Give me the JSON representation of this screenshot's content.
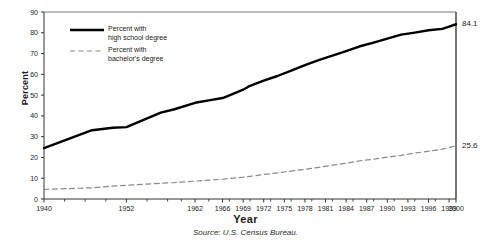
{
  "chart_data": {
    "type": "line",
    "title": "",
    "xlabel": "Year",
    "ylabel": "Percent",
    "source": "Source: U.S. Census Bureau.",
    "xlim": [
      1940,
      2000
    ],
    "ylim": [
      0,
      90
    ],
    "ytick_step": 10,
    "grid": false,
    "legend_position": "top-left-inside",
    "yticks": [
      "0",
      "10",
      "20",
      "30",
      "40",
      "50",
      "60",
      "70",
      "80",
      "90"
    ],
    "xticks": [
      "1940",
      "1952",
      "1962",
      "1966",
      "1969",
      "1972",
      "1975",
      "1978",
      "1981",
      "1984",
      "1987",
      "1990",
      "1993",
      "1996",
      "1999",
      "2000"
    ],
    "xtick_positions": [
      1940,
      1952,
      1962,
      1966,
      1969,
      1972,
      1975,
      1978,
      1981,
      1984,
      1987,
      1990,
      1993,
      1996,
      1999,
      2000
    ],
    "minor_xticks": [
      1943,
      1946,
      1949,
      1955,
      1958,
      1960,
      1964,
      1967,
      1970,
      1973,
      1976,
      1979,
      1982,
      1985,
      1988,
      1991,
      1994,
      1997
    ],
    "series": [
      {
        "name": "Percent with high school degree",
        "legend_label": "Percent with\nhigh school degree",
        "style": "solid",
        "color": "#000000",
        "width": 2.4,
        "end_value_label": "84.1",
        "x": [
          1940,
          1947,
          1950,
          1952,
          1957,
          1959,
          1962,
          1964,
          1966,
          1967,
          1969,
          1970,
          1972,
          1974,
          1976,
          1978,
          1980,
          1982,
          1984,
          1986,
          1988,
          1990,
          1992,
          1994,
          1996,
          1998,
          1999,
          2000
        ],
        "values": [
          24.5,
          33.1,
          34.3,
          34.6,
          41.6,
          43.2,
          46.3,
          47.5,
          48.6,
          49.9,
          52.6,
          54.5,
          57.0,
          59.2,
          61.8,
          64.4,
          66.8,
          69.0,
          71.2,
          73.5,
          75.3,
          77.2,
          79.1,
          80.1,
          81.2,
          81.9,
          83.0,
          84.1
        ]
      },
      {
        "name": "Percent with bachelor's degree",
        "legend_label": "Percent with\nbachelor's degree",
        "style": "dashed",
        "color": "#8a8a8a",
        "width": 1.2,
        "end_value_label": "25.6",
        "x": [
          1940,
          1947,
          1950,
          1952,
          1957,
          1959,
          1962,
          1964,
          1966,
          1967,
          1969,
          1970,
          1972,
          1974,
          1976,
          1978,
          1980,
          1982,
          1984,
          1986,
          1988,
          1990,
          1992,
          1994,
          1996,
          1998,
          1999,
          2000
        ],
        "values": [
          4.6,
          5.4,
          6.2,
          6.6,
          7.6,
          7.9,
          8.6,
          9.1,
          9.5,
          9.9,
          10.5,
          10.9,
          11.8,
          12.6,
          13.4,
          14.3,
          15.2,
          16.3,
          17.2,
          18.4,
          19.1,
          20.2,
          21.0,
          22.1,
          23.0,
          24.0,
          24.8,
          25.6
        ]
      }
    ]
  },
  "axes": {
    "plot_left_px": 44,
    "plot_right_px": 456,
    "plot_top_px": 12,
    "plot_bottom_px": 199
  }
}
